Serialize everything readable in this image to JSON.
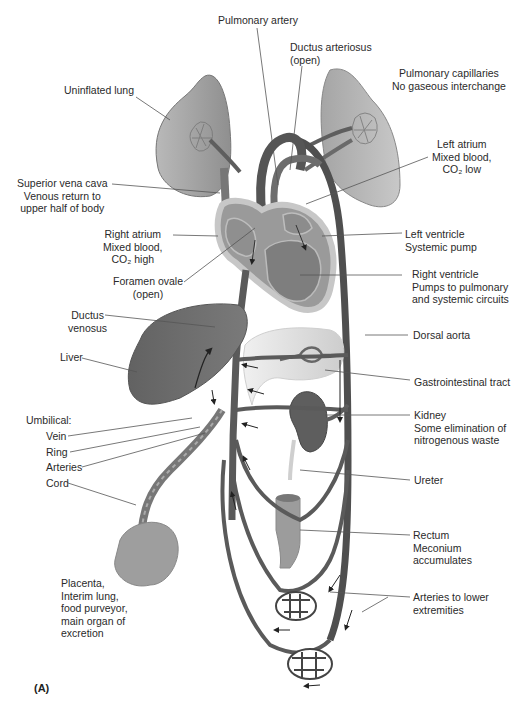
{
  "figure": {
    "panel_label": "(A)",
    "palette": {
      "vessel": "#5e5e5e",
      "organ_dark": "#6b6b6b",
      "organ_mid": "#9a9a9a",
      "organ_light": "#d2d2d2",
      "leader": "#555555",
      "text": "#2a2a2a"
    }
  },
  "labels": {
    "pulmonary_artery": [
      "Pulmonary artery"
    ],
    "ductus_arteriosus": [
      "Ductus arteriosus",
      "(open)"
    ],
    "uninflated_lung": [
      "Uninflated lung"
    ],
    "pulmonary_capillaries": [
      "Pulmonary capillaries",
      "No gaseous interchange"
    ],
    "left_atrium": [
      "Left atrium",
      "Mixed blood,",
      "CO₂ low"
    ],
    "superior_vena_cava": [
      "Superior vena cava",
      "Venous return to",
      "upper half of body"
    ],
    "right_atrium": [
      "Right atrium",
      "Mixed blood,",
      "CO₂ high"
    ],
    "left_ventricle": [
      "Left ventricle",
      "Systemic pump"
    ],
    "foramen_ovale": [
      "Foramen ovale",
      "(open)"
    ],
    "right_ventricle": [
      "Right ventricle",
      "Pumps to pulmonary",
      "and systemic circuits"
    ],
    "ductus_venosus": [
      "Ductus",
      "venosus"
    ],
    "dorsal_aorta": [
      "Dorsal aorta"
    ],
    "liver": [
      "Liver"
    ],
    "gastrointestinal_tract": [
      "Gastrointestinal tract"
    ],
    "umbilical_heading": [
      "Umbilical:"
    ],
    "umbilical_vein": [
      "Vein"
    ],
    "umbilical_ring": [
      "Ring"
    ],
    "umbilical_arteries": [
      "Arteries"
    ],
    "umbilical_cord": [
      "Cord"
    ],
    "kidney": [
      "Kidney",
      "Some elimination of",
      "nitrogenous waste"
    ],
    "ureter": [
      "Ureter"
    ],
    "rectum": [
      "Rectum",
      "Meconium",
      "accumulates"
    ],
    "placenta": [
      "Placenta,",
      "Interim lung,",
      "food purveyor,",
      "main organ of",
      "excretion"
    ],
    "arteries_lower": [
      "Arteries to lower",
      "extremities"
    ]
  }
}
